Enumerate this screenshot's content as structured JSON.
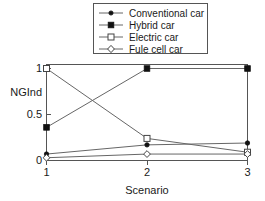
{
  "chart_data": {
    "type": "line",
    "title": "",
    "xlabel": "Scenario",
    "ylabel": "NGInd",
    "categories": [
      "1",
      "2",
      "3"
    ],
    "x": [
      1,
      2,
      3
    ],
    "xlim": [
      1,
      3
    ],
    "ylim": [
      0,
      1.08
    ],
    "xticks": [
      "1",
      "2",
      "3"
    ],
    "yticks": [
      "0",
      "0.5",
      "1"
    ],
    "ytick_values": [
      0,
      0.5,
      1
    ],
    "grid": false,
    "legend_position": "top-center",
    "series": [
      {
        "name": "Conventional car",
        "marker": "filled-circle",
        "values": [
          0.07,
          0.17,
          0.19
        ]
      },
      {
        "name": "Hybrid car",
        "marker": "filled-square",
        "values": [
          0.36,
          1.0,
          1.0
        ]
      },
      {
        "name": "Electric car",
        "marker": "open-square",
        "values": [
          1.0,
          0.24,
          0.09
        ]
      },
      {
        "name": "Fule cell car",
        "marker": "open-diamond",
        "values": [
          0.03,
          0.07,
          0.07
        ]
      }
    ],
    "colors": {
      "line": "#666666",
      "marker_fill": "#111111",
      "marker_open_fill": "#ffffff",
      "axis": "#555555",
      "text": "#1a1a1a",
      "background": "#ffffff"
    }
  }
}
